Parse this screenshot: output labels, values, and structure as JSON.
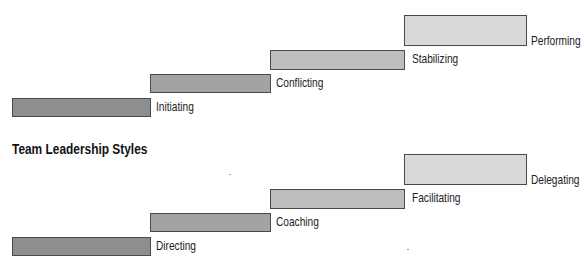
{
  "diagrams": [
    {
      "title": "",
      "stages": [
        {
          "label": "Initiating",
          "color": "#8e8e8e"
        },
        {
          "label": "Conflicting",
          "color": "#a3a3a3"
        },
        {
          "label": "Stabilizing",
          "color": "#bdbdbd"
        },
        {
          "label": "Performing",
          "color": "#d9d9d9"
        }
      ]
    },
    {
      "title": "Team Leadership Styles",
      "stages": [
        {
          "label": "Directing",
          "color": "#8e8e8e"
        },
        {
          "label": "Coaching",
          "color": "#a3a3a3"
        },
        {
          "label": "Facilitating",
          "color": "#bdbdbd"
        },
        {
          "label": "Delegating",
          "color": "#d9d9d9"
        }
      ]
    }
  ]
}
